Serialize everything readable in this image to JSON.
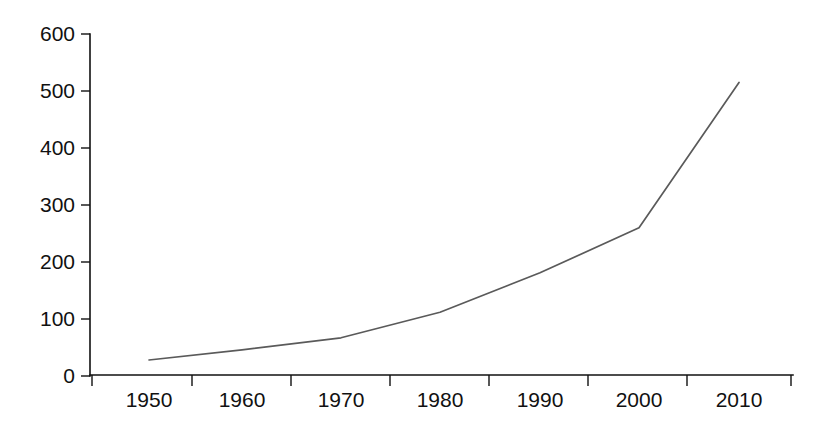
{
  "chart_data": {
    "type": "line",
    "title": "",
    "subtitle": "",
    "xlabel": "",
    "ylabel": "",
    "categories": [
      "1950",
      "1960",
      "1970",
      "1980",
      "1990",
      "2000",
      "2010"
    ],
    "x": [
      1950,
      1960,
      1970,
      1980,
      1990,
      2000,
      2010
    ],
    "values": [
      28,
      46,
      67,
      112,
      181,
      260,
      515
    ],
    "series": [
      {
        "name": "series-1",
        "values": [
          28,
          46,
          67,
          112,
          181,
          260,
          515
        ],
        "color": "#5a5a5a"
      }
    ],
    "xlim": [
      1945,
      1015
    ],
    "ylim": [
      0,
      600
    ],
    "yticks": [
      0,
      100,
      200,
      300,
      400,
      500,
      600
    ],
    "ytick_labels": [
      "0",
      "100",
      "200",
      "300",
      "400",
      "500",
      "600"
    ],
    "xtick_labels": [
      "1950",
      "1960",
      "1970",
      "1980",
      "1990",
      "2000",
      "2010"
    ],
    "grid": false,
    "legend": false,
    "legend_position": "none",
    "line_color": "#5a5a5a",
    "axis_color": "#111111",
    "background": "#ffffff"
  },
  "axes": {
    "y_axis_name": "y-axis",
    "x_axis_name": "x-axis"
  }
}
